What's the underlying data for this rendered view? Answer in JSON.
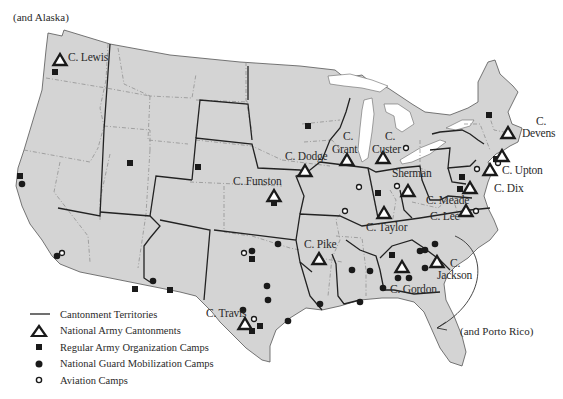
{
  "notes": {
    "alaska": "(and Alaska)",
    "porto_rico": "(and Porto Rico)"
  },
  "colors": {
    "land": "#d4d4d4",
    "water": "#ffffff",
    "territory_line": "#222222",
    "state_line": "#7a7a7a",
    "symbol": "#1a1a1a"
  },
  "legend": {
    "items": [
      {
        "symbol": "line",
        "label": "Cantonment Territories"
      },
      {
        "symbol": "triangle",
        "label": "National Army Cantonments"
      },
      {
        "symbol": "square",
        "label": "Regular Army Organization Camps"
      },
      {
        "symbol": "dot",
        "label": "National Guard Mobilization Camps"
      },
      {
        "symbol": "ring",
        "label": "Aviation Camps"
      }
    ]
  },
  "cantonments": [
    {
      "name": "C. Lewis",
      "x": 60,
      "y": 60
    },
    {
      "name": "C. Funston",
      "x": 274,
      "y": 196
    },
    {
      "name": "C. Dodge",
      "x": 305,
      "y": 171
    },
    {
      "name": "C. Grant",
      "x": 347,
      "y": 160
    },
    {
      "name": "C. Custer",
      "x": 383,
      "y": 158
    },
    {
      "name": "C. Sherman",
      "x": 408,
      "y": 191
    },
    {
      "name": "C. Taylor",
      "x": 384,
      "y": 213
    },
    {
      "name": "C. Devens",
      "x": 508,
      "y": 133
    },
    {
      "name": "C. Upton",
      "x": 502,
      "y": 156
    },
    {
      "name": "C. Dix",
      "x": 490,
      "y": 170
    },
    {
      "name": "C. Meade",
      "x": 470,
      "y": 188
    },
    {
      "name": "C. Lee",
      "x": 466,
      "y": 211
    },
    {
      "name": "C. Pike",
      "x": 319,
      "y": 259
    },
    {
      "name": "C. Gordon",
      "x": 402,
      "y": 267
    },
    {
      "name": "C. Jackson",
      "x": 437,
      "y": 262
    },
    {
      "name": "C. Travis",
      "x": 245,
      "y": 324
    }
  ],
  "labels": [
    {
      "text": "C. Lewis",
      "x": 68,
      "y": 52
    },
    {
      "text": "C. Funston",
      "x": 233,
      "y": 176
    },
    {
      "text": "C. Dodge",
      "x": 285,
      "y": 151
    },
    {
      "text": "C.",
      "x": 343,
      "y": 131
    },
    {
      "text": "Grant",
      "x": 332,
      "y": 144
    },
    {
      "text": "C.",
      "x": 385,
      "y": 131
    },
    {
      "text": "Custer",
      "x": 372,
      "y": 144
    },
    {
      "text": "Sherman",
      "x": 392,
      "y": 168
    },
    {
      "text": "C. Taylor",
      "x": 366,
      "y": 222
    },
    {
      "text": "C.",
      "x": 536,
      "y": 116
    },
    {
      "text": "Devens",
      "x": 522,
      "y": 128
    },
    {
      "text": "C. Upton",
      "x": 502,
      "y": 165
    },
    {
      "text": "C. Dix",
      "x": 494,
      "y": 183
    },
    {
      "text": "C. Meade",
      "x": 426,
      "y": 195
    },
    {
      "text": "C. Lee",
      "x": 430,
      "y": 211
    },
    {
      "text": "C. Pike",
      "x": 304,
      "y": 239
    },
    {
      "text": "C. Gordon",
      "x": 390,
      "y": 284
    },
    {
      "text": "C.",
      "x": 450,
      "y": 258
    },
    {
      "text": "Jackson",
      "x": 437,
      "y": 270
    },
    {
      "text": "C. Travis",
      "x": 206,
      "y": 308
    }
  ],
  "regular_army_camps": [
    {
      "x": 55,
      "y": 72
    },
    {
      "x": 20,
      "y": 176
    },
    {
      "x": 130,
      "y": 163
    },
    {
      "x": 198,
      "y": 167
    },
    {
      "x": 274,
      "y": 203
    },
    {
      "x": 308,
      "y": 126
    },
    {
      "x": 378,
      "y": 193
    },
    {
      "x": 489,
      "y": 115
    },
    {
      "x": 462,
      "y": 177
    },
    {
      "x": 460,
      "y": 189
    },
    {
      "x": 496,
      "y": 159
    },
    {
      "x": 252,
      "y": 259
    },
    {
      "x": 392,
      "y": 255
    },
    {
      "x": 135,
      "y": 289
    },
    {
      "x": 170,
      "y": 290
    },
    {
      "x": 252,
      "y": 331
    },
    {
      "x": 260,
      "y": 326
    }
  ],
  "national_guard_camps": [
    {
      "x": 22,
      "y": 184
    },
    {
      "x": 57,
      "y": 256
    },
    {
      "x": 252,
      "y": 251
    },
    {
      "x": 153,
      "y": 281
    },
    {
      "x": 267,
      "y": 286
    },
    {
      "x": 268,
      "y": 300
    },
    {
      "x": 243,
      "y": 310
    },
    {
      "x": 288,
      "y": 321
    },
    {
      "x": 320,
      "y": 304
    },
    {
      "x": 370,
      "y": 271
    },
    {
      "x": 383,
      "y": 288
    },
    {
      "x": 409,
      "y": 278
    },
    {
      "x": 435,
      "y": 244
    },
    {
      "x": 420,
      "y": 251
    },
    {
      "x": 425,
      "y": 250
    },
    {
      "x": 425,
      "y": 268
    },
    {
      "x": 360,
      "y": 302
    },
    {
      "x": 352,
      "y": 270
    },
    {
      "x": 278,
      "y": 244
    },
    {
      "x": 398,
      "y": 278
    }
  ],
  "aviation_camps": [
    {
      "x": 62,
      "y": 253
    },
    {
      "x": 359,
      "y": 187
    },
    {
      "x": 345,
      "y": 211
    },
    {
      "x": 244,
      "y": 253
    },
    {
      "x": 254,
      "y": 319
    },
    {
      "x": 406,
      "y": 148
    },
    {
      "x": 477,
      "y": 169
    },
    {
      "x": 498,
      "y": 163
    },
    {
      "x": 476,
      "y": 211
    },
    {
      "x": 397,
      "y": 186
    }
  ]
}
